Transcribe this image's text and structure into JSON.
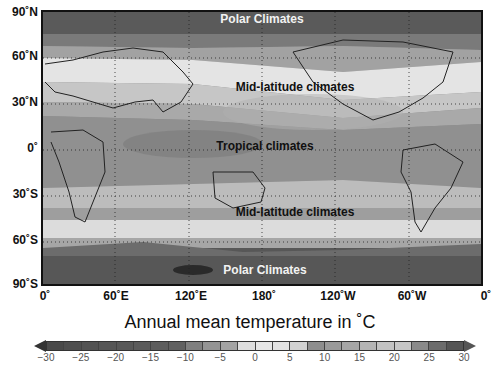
{
  "map": {
    "title": "Annual mean temperature in ˚C",
    "lat_labels": [
      "90˚N",
      "60˚N",
      "30˚N",
      "0˚",
      "30˚S",
      "60˚S",
      "90˚S"
    ],
    "lon_labels": [
      "0˚",
      "60˚E",
      "120˚E",
      "180˚",
      "120˚W",
      "60˚W",
      "0˚"
    ],
    "zones": [
      {
        "label": "Polar Climates",
        "position": "north"
      },
      {
        "label": "Mid-latitude climates",
        "position": "northern-mid"
      },
      {
        "label": "Tropical climates",
        "position": "equator"
      },
      {
        "label": "Mid-latitude climates",
        "position": "southern-mid"
      },
      {
        "label": "Polar Climates",
        "position": "south"
      }
    ]
  },
  "colorbar": {
    "min": -30,
    "max": 30,
    "step": 2.5,
    "tick_labels": [
      "−30",
      "−25",
      "−20",
      "−15",
      "−10",
      "−5",
      "0",
      "5",
      "10",
      "15",
      "20",
      "25",
      "30"
    ],
    "segment_colors": [
      "#4a4a4a",
      "#4f4f4f",
      "#535353",
      "#565656",
      "#585858",
      "#5b5b5b",
      "#5d5d5d",
      "#606060",
      "#7f7f7f",
      "#949494",
      "#a3a3a3",
      "#dedede",
      "#e6e6e6",
      "#e2e2e2",
      "#d2d2d2",
      "#8e8e8e",
      "#9a9a9a",
      "#a6a6a6",
      "#b4b4b4",
      "#c2c2c2",
      "#c6c6c6",
      "#8a8a8a",
      "#6c6c6c",
      "#555555"
    ]
  },
  "chart_data": {
    "type": "heatmap",
    "title": "Annual mean temperature in ˚C",
    "xlabel": "Longitude",
    "ylabel": "Latitude",
    "x_ticks": [
      "0˚",
      "60˚E",
      "120˚E",
      "180˚",
      "120˚W",
      "60˚W",
      "0˚"
    ],
    "y_ticks": [
      "90˚N",
      "60˚N",
      "30˚N",
      "0˚",
      "30˚S",
      "60˚S",
      "90˚S"
    ],
    "colorbar": {
      "min": -30,
      "max": 30,
      "ticks": [
        -30,
        -25,
        -20,
        -15,
        -10,
        -5,
        0,
        5,
        10,
        15,
        20,
        25,
        30
      ],
      "interval": 2.5,
      "extend": "both"
    },
    "grid": true,
    "annotations": [
      "Polar Climates",
      "Mid-latitude climates",
      "Tropical climates",
      "Mid-latitude climates",
      "Polar Climates"
    ],
    "zonal_bands_approx": [
      {
        "lat_range": [
          75,
          90
        ],
        "temp_c": -20,
        "zone": "Polar Climates"
      },
      {
        "lat_range": [
          60,
          75
        ],
        "temp_c": -5
      },
      {
        "lat_range": [
          30,
          60
        ],
        "temp_c": 10,
        "zone": "Mid-latitude climates"
      },
      {
        "lat_range": [
          -20,
          30
        ],
        "temp_c": 26,
        "zone": "Tropical climates"
      },
      {
        "lat_range": [
          -55,
          -20
        ],
        "temp_c": 12,
        "zone": "Mid-latitude climates"
      },
      {
        "lat_range": [
          -65,
          -55
        ],
        "temp_c": 0
      },
      {
        "lat_range": [
          -90,
          -65
        ],
        "temp_c": -25,
        "zone": "Polar Climates"
      }
    ]
  }
}
